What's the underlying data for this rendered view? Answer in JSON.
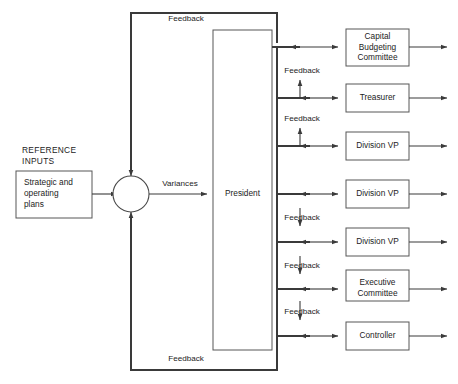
{
  "diagram": {
    "colors": {
      "line": "#3a3a3a",
      "box_stroke": "#565656",
      "text": "#1c1c1c",
      "background": "#ffffff"
    },
    "reference_inputs": {
      "caption_line1": "REFERENCE",
      "caption_line2": "INPUTS",
      "box_line1": "Strategic and",
      "box_line2": "operating",
      "box_line3": "plans"
    },
    "summing_junction": {
      "name": "comparator",
      "output_label": "Variances"
    },
    "processor": {
      "label": "President"
    },
    "units": [
      {
        "id": "capital-budgeting-committee",
        "line1": "Capital",
        "line2": "Budgeting",
        "line3": "Committee"
      },
      {
        "id": "treasurer",
        "line1": "Treasurer",
        "line2": "",
        "line3": ""
      },
      {
        "id": "division-vp-1",
        "line1": "Division VP",
        "line2": "",
        "line3": ""
      },
      {
        "id": "division-vp-2",
        "line1": "Division VP",
        "line2": "",
        "line3": ""
      },
      {
        "id": "division-vp-3",
        "line1": "Division VP",
        "line2": "",
        "line3": ""
      },
      {
        "id": "executive-committee",
        "line1": "Executive",
        "line2": "Committee",
        "line3": ""
      },
      {
        "id": "controller",
        "line1": "Controller",
        "line2": "",
        "line3": ""
      }
    ],
    "feedback_labels": {
      "top": "Feedback",
      "bottom": "Feedback",
      "inner_1": "Feedback",
      "inner_2": "Feedback",
      "inner_3": "Feedback",
      "inner_4": "Feedback",
      "inner_5": "Feedback"
    }
  }
}
